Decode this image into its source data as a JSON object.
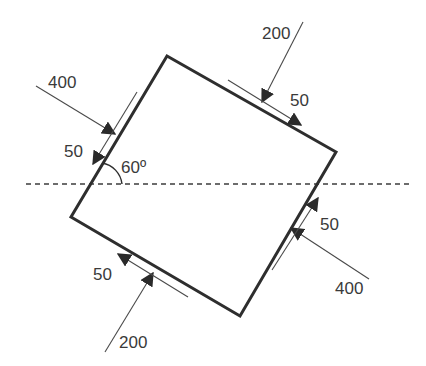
{
  "diagram": {
    "type": "stress-element",
    "colors": {
      "stroke": "#2e2e2e",
      "text": "#3a3a3a",
      "background": "#ffffff"
    },
    "reference_line": {
      "style": "dashed",
      "orientation": "horizontal"
    },
    "angle": {
      "label": "60º",
      "value_deg": 60
    },
    "faces": [
      {
        "side": "upper-left",
        "normal": {
          "label": "400",
          "value": 400
        },
        "shear": {
          "label": "50",
          "value": 50
        }
      },
      {
        "side": "upper-right",
        "normal": {
          "label": "200",
          "value": 200
        },
        "shear": {
          "label": "50",
          "value": 50
        }
      },
      {
        "side": "lower-left",
        "normal": {
          "label": "200",
          "value": 200
        },
        "shear": {
          "label": "50",
          "value": 50
        }
      },
      {
        "side": "lower-right",
        "normal": {
          "label": "400",
          "value": 400
        },
        "shear": {
          "label": "50",
          "value": 50
        }
      }
    ]
  }
}
